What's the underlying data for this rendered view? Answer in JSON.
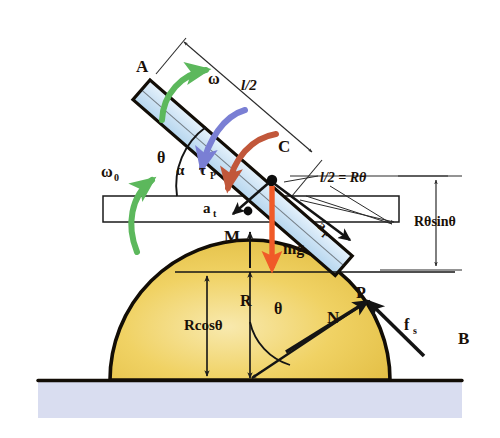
{
  "figure": {
    "background_color": "#ffffff"
  },
  "colors": {
    "dome_fill": "#eecb55",
    "dome_fill_light": "#f7e7a8",
    "dome_edge": "#120d06",
    "rod_fill": "#cfe4f5",
    "rod_edge": "#120d06",
    "bar_fill": "#ffffff",
    "bar_edge": "#120d06",
    "ground_fill": "#d9ddf0",
    "ground_line": "#120d06",
    "omega_arrow": "#5cb85c",
    "torque_arrow": "#7a7fd4",
    "alpha_arrow": "#c1573a",
    "mg_arrow": "#f05a28",
    "at_arrow": "#f05a28",
    "ar_arrow": "#f05a28",
    "dimension_line": "#2a2a2a",
    "text": "#1a1008"
  },
  "labels": {
    "rod_end_A": "A",
    "rod_center_C": "C",
    "contact_point_P": "P",
    "dome_body_B": "B",
    "dome_mass_M": "M",
    "angular_velocity": "ω",
    "initial_angular_velocity": "ω",
    "initial_angular_velocity_sub": "0",
    "angular_acceleration": "α",
    "torque": "τ",
    "torque_sub": "P",
    "half_length": "l/2",
    "arc_relation": "l/2 = Rθ",
    "height_dimension": "Rθsinθ",
    "radius": "R",
    "radius_projection": "Rcosθ",
    "angle_theta_rod": "θ",
    "angle_theta_dome": "θ",
    "weight": "mg",
    "tangential_acceleration": "a",
    "tangential_acceleration_sub": "t",
    "radial_acceleration": "a",
    "radial_acceleration_sub": "r",
    "normal_force": "N",
    "friction_force": "f",
    "friction_force_sub": "s"
  },
  "geometry": {
    "dome_center_x": 250,
    "dome_center_y": 380,
    "dome_radius": 140,
    "ground_y": 380,
    "contact_point_x": 368,
    "contact_point_y": 305,
    "rod_angle_deg": 41,
    "horizontal_bar_y": 208,
    "horizontal_bar_height": 26
  }
}
